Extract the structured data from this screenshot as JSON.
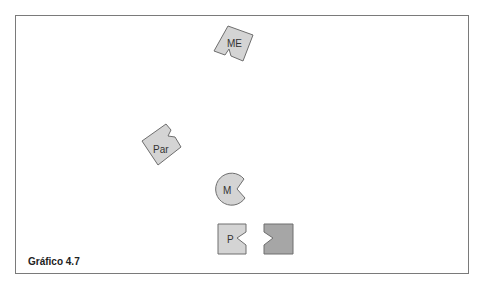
{
  "figure": {
    "caption": "Gráfico 4.7",
    "shapes": [
      {
        "id": "me",
        "label": "ME",
        "fill": "#d4d4d4"
      },
      {
        "id": "par",
        "label": "Par",
        "fill": "#d4d4d4"
      },
      {
        "id": "m",
        "label": "M",
        "fill": "#d4d4d4"
      },
      {
        "id": "p",
        "label": "P",
        "fill": "#d4d4d4"
      },
      {
        "id": "p-complement",
        "label": "",
        "fill": "#a6a6a6"
      }
    ],
    "colors": {
      "border": "#7a7a7a",
      "stroke": "#6e6e6e"
    }
  }
}
